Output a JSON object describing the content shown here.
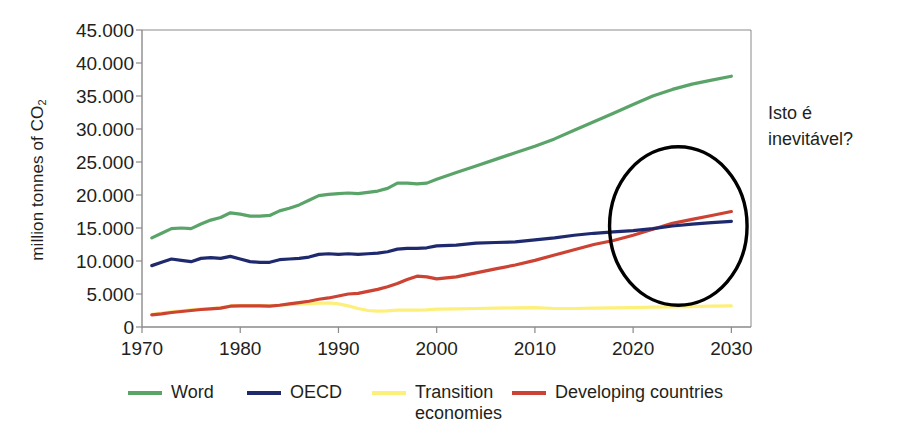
{
  "chart_data": {
    "type": "line",
    "title": "",
    "xlabel": "",
    "ylabel": "million tonnes of CO2",
    "ylabel_prefix": "million tonnes of CO",
    "ylabel_subscript": "2",
    "xlim": [
      1970,
      2032
    ],
    "ylim": [
      0,
      45000
    ],
    "x_ticks": [
      "1970",
      "1980",
      "1990",
      "2000",
      "2010",
      "2020",
      "2030"
    ],
    "x_tick_values": [
      1970,
      1980,
      1990,
      2000,
      2010,
      2020,
      2030
    ],
    "y_ticks": [
      "0",
      "5.000",
      "10.000",
      "15.000",
      "20.000",
      "25.000",
      "30.000",
      "35.000",
      "40.000",
      "45.000"
    ],
    "y_tick_values": [
      0,
      5000,
      10000,
      15000,
      20000,
      25000,
      30000,
      35000,
      40000,
      45000
    ],
    "grid": false,
    "legend_position": "bottom",
    "x": [
      1971,
      1972,
      1973,
      1974,
      1975,
      1976,
      1977,
      1978,
      1979,
      1980,
      1981,
      1982,
      1983,
      1984,
      1985,
      1986,
      1987,
      1988,
      1989,
      1990,
      1991,
      1992,
      1993,
      1994,
      1995,
      1996,
      1997,
      1998,
      1999,
      2000,
      2002,
      2004,
      2006,
      2008,
      2010,
      2012,
      2014,
      2016,
      2018,
      2020,
      2022,
      2024,
      2026,
      2028,
      2030
    ],
    "series": [
      {
        "name": "Word",
        "color": "#5aa469",
        "values": [
          13500,
          14200,
          14900,
          15000,
          14900,
          15600,
          16200,
          16600,
          17300,
          17100,
          16800,
          16800,
          16900,
          17600,
          18000,
          18500,
          19200,
          19900,
          20100,
          20200,
          20300,
          20200,
          20400,
          20600,
          21000,
          21800,
          21800,
          21700,
          21800,
          22400,
          23400,
          24400,
          25400,
          26400,
          27400,
          28500,
          29800,
          31100,
          32400,
          33700,
          35000,
          36000,
          36800,
          37400,
          38000
        ]
      },
      {
        "name": "OECD",
        "color": "#1f2a6e",
        "values": [
          9300,
          9800,
          10300,
          10100,
          9900,
          10400,
          10500,
          10400,
          10700,
          10300,
          9900,
          9800,
          9800,
          10200,
          10300,
          10400,
          10600,
          11000,
          11100,
          11000,
          11100,
          11000,
          11100,
          11200,
          11400,
          11800,
          11900,
          11900,
          12000,
          12300,
          12400,
          12700,
          12800,
          12900,
          13200,
          13500,
          13900,
          14200,
          14400,
          14600,
          14900,
          15300,
          15600,
          15800,
          16000
        ]
      },
      {
        "name": "Transition\neconomies",
        "color": "#fdf07a",
        "values": [
          1900,
          2100,
          2300,
          2450,
          2600,
          2700,
          2800,
          2900,
          3200,
          3250,
          3250,
          3250,
          3200,
          3300,
          3400,
          3450,
          3500,
          3600,
          3650,
          3500,
          3200,
          2800,
          2500,
          2400,
          2450,
          2550,
          2550,
          2550,
          2600,
          2700,
          2750,
          2800,
          2850,
          2900,
          2950,
          2800,
          2800,
          2850,
          2900,
          2950,
          3000,
          3050,
          3100,
          3150,
          3200
        ]
      },
      {
        "name": "Developing countries",
        "color": "#cc4233",
        "values": [
          1850,
          2000,
          2200,
          2350,
          2500,
          2650,
          2750,
          2850,
          3150,
          3200,
          3200,
          3200,
          3150,
          3300,
          3500,
          3700,
          3900,
          4200,
          4400,
          4700,
          5000,
          5100,
          5400,
          5700,
          6100,
          6600,
          7200,
          7700,
          7600,
          7300,
          7600,
          8200,
          8800,
          9400,
          10100,
          10900,
          11700,
          12500,
          13100,
          13900,
          14800,
          15700,
          16300,
          16900,
          17500
        ]
      }
    ],
    "annotations": [
      {
        "name": "circle-highlight",
        "shape": "ellipse",
        "cx_year": 2024.6,
        "cy_value": 15300,
        "rx_years": 7.0,
        "ry_value": 12000,
        "color": "#000000"
      },
      {
        "name": "question-text",
        "text": "Isto é\ninevitável?"
      }
    ]
  },
  "axis": {
    "y_title_prefix": "million tonnes of CO",
    "y_title_sub": "2"
  },
  "annotation": {
    "question": "Isto é\ninevitável?"
  },
  "legend": {
    "items": [
      {
        "label": "Word",
        "color": "#5aa469"
      },
      {
        "label": "OECD",
        "color": "#1f2a6e"
      },
      {
        "label": "Transition\neconomies",
        "color": "#fdf07a"
      },
      {
        "label": "Developing countries",
        "color": "#cc4233"
      }
    ]
  },
  "colors": {
    "axis": "#8a8a8a",
    "text": "#231f20",
    "background": "#ffffff"
  }
}
